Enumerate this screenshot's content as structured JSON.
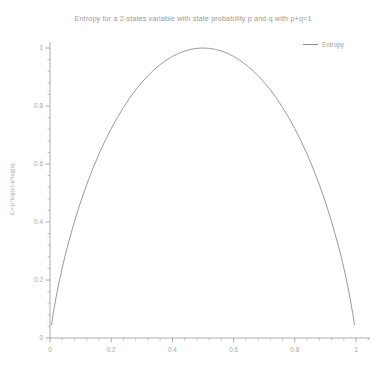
{
  "chart_data": {
    "type": "line",
    "title": "Entropy for a 2-states variable with state probability p and q with p+q=1",
    "xlabel": "",
    "ylabel": "E=-p*log(p)-q*log(q)",
    "xlim": [
      0,
      1
    ],
    "ylim": [
      0,
      1
    ],
    "grid": false,
    "legend_position": "top-right",
    "xticks": [
      "0",
      "0.2",
      "0.4",
      "0.6",
      "0.8",
      "1"
    ],
    "xtick_values": [
      0,
      0.2,
      0.4,
      0.6,
      0.8,
      1
    ],
    "yticks": [
      "0",
      "0.2",
      "0.4",
      "0.6",
      "0.8",
      "1"
    ],
    "ytick_values": [
      0,
      0.2,
      0.4,
      0.6,
      0.8,
      1
    ],
    "minor_ticks_per_interval": 5,
    "series": [
      {
        "name": "Entropy",
        "color": "#8e8e8e",
        "x": [
          0.005,
          0.01,
          0.02,
          0.03,
          0.04,
          0.05,
          0.06,
          0.08,
          0.1,
          0.12,
          0.14,
          0.16,
          0.18,
          0.2,
          0.22,
          0.24,
          0.26,
          0.28,
          0.3,
          0.32,
          0.34,
          0.36,
          0.38,
          0.4,
          0.42,
          0.44,
          0.46,
          0.48,
          0.5,
          0.52,
          0.54,
          0.56,
          0.58,
          0.6,
          0.62,
          0.64,
          0.66,
          0.68,
          0.7,
          0.72,
          0.74,
          0.76,
          0.78,
          0.8,
          0.82,
          0.84,
          0.86,
          0.88,
          0.9,
          0.92,
          0.94,
          0.95,
          0.96,
          0.97,
          0.98,
          0.99,
          0.995
        ],
        "y": [
          0.0454,
          0.0808,
          0.1414,
          0.1944,
          0.2423,
          0.2864,
          0.3274,
          0.4022,
          0.469,
          0.5294,
          0.5842,
          0.6343,
          0.6801,
          0.7219,
          0.7602,
          0.795,
          0.8267,
          0.8555,
          0.8813,
          0.9044,
          0.9249,
          0.9427,
          0.958,
          0.971,
          0.9815,
          0.9896,
          0.9954,
          0.9988,
          1.0,
          0.9988,
          0.9954,
          0.9896,
          0.9815,
          0.971,
          0.958,
          0.9427,
          0.9249,
          0.9044,
          0.8813,
          0.8555,
          0.8267,
          0.795,
          0.7602,
          0.7219,
          0.6801,
          0.6343,
          0.5842,
          0.5294,
          0.469,
          0.4022,
          0.3274,
          0.2864,
          0.2423,
          0.1944,
          0.1414,
          0.0808,
          0.0454
        ]
      }
    ]
  },
  "legend": {
    "entries": [
      {
        "label": "Entropy"
      }
    ]
  },
  "axis": {
    "color": "#9a9a9a"
  }
}
